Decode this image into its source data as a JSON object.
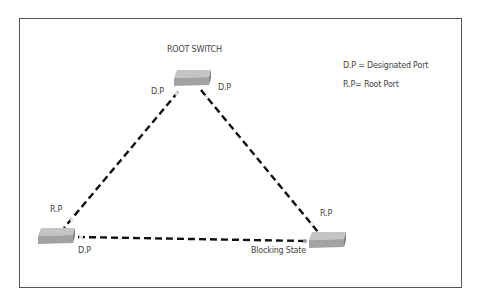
{
  "diagram": {
    "title": "ROOT SWITCH",
    "legend": [
      {
        "text": "D.P = Designated Port"
      },
      {
        "text": "R.P= Root Port"
      }
    ],
    "nodes": [
      {
        "id": "root-switch",
        "label": "ROOT SWITCH",
        "x": 193,
        "y": 78
      },
      {
        "id": "left-switch",
        "x": 57,
        "y": 236
      },
      {
        "id": "right-switch",
        "x": 327,
        "y": 241
      }
    ],
    "port_labels": {
      "root_left": "D.P",
      "root_right": "D.P",
      "left_up": "R.P",
      "left_right": "D.P",
      "right_up": "R.P",
      "right_left": "Blocking State"
    },
    "links": [
      {
        "from": "root-switch",
        "to": "left-switch",
        "style": "dashed"
      },
      {
        "from": "root-switch",
        "to": "right-switch",
        "style": "dashed"
      },
      {
        "from": "left-switch",
        "to": "right-switch",
        "style": "dashed"
      }
    ],
    "colors": {
      "line": "#111111",
      "switch_top": "#b5b5b5",
      "switch_side": "#8d8d8d",
      "border": "#555555"
    }
  }
}
